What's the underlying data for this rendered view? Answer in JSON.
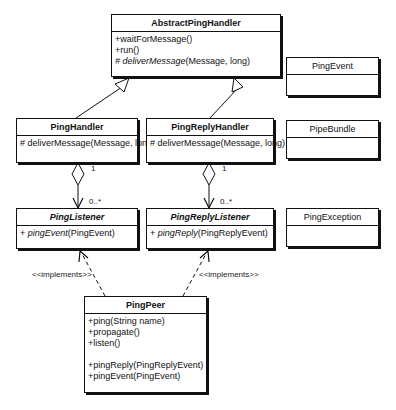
{
  "diagram": {
    "type": "UML class diagram",
    "classes": {
      "abstract_ping_handler": {
        "name": "AbstractPingHandler",
        "operations": [
          {
            "prefix": "+",
            "name": "waitForMessage",
            "params": "()",
            "italic": false
          },
          {
            "prefix": "+",
            "name": "run",
            "params": "()",
            "italic": false
          },
          {
            "prefix": "# ",
            "name": "deliverMessage",
            "params": "(Message, long)",
            "italic": true
          }
        ]
      },
      "ping_handler": {
        "name": "PingHandler",
        "operations": [
          {
            "prefix": "# ",
            "name": "deliverMessage",
            "params": "(Message, long)",
            "italic": false
          }
        ]
      },
      "ping_reply_handler": {
        "name": "PingReplyHandler",
        "operations": [
          {
            "prefix": "# ",
            "name": "deliverMessage",
            "params": "(Message, long)",
            "italic": false
          }
        ]
      },
      "ping_listener": {
        "name": "PingListener",
        "operations": [
          {
            "prefix": "+ ",
            "name": "pingEvent",
            "params": "(PingEvent)",
            "italic": true
          }
        ]
      },
      "ping_reply_listener": {
        "name": "PingReplyListener",
        "operations": [
          {
            "prefix": "+ ",
            "name": "pingReply",
            "params": "(PingReplyEvent)",
            "italic": true
          }
        ]
      },
      "ping_peer": {
        "name": "PingPeer",
        "operations": [
          {
            "prefix": "+",
            "name": "ping",
            "params": "(String name)"
          },
          {
            "prefix": "+",
            "name": "propagate",
            "params": "()"
          },
          {
            "prefix": "+",
            "name": "listen",
            "params": "()"
          },
          {
            "prefix": "+",
            "name": "pingReply",
            "params": "(PingReplyEvent)"
          },
          {
            "prefix": "+",
            "name": "pingEvent",
            "params": "(PingEvent)"
          }
        ]
      },
      "ping_event": {
        "name": "PingEvent"
      },
      "pipe_bundle": {
        "name": "PipeBundle"
      },
      "ping_exception": {
        "name": "PingException"
      }
    },
    "labels": {
      "mult_one_left": "1",
      "mult_many_left": "0..*",
      "mult_one_right": "1",
      "mult_many_right": "0..*",
      "implements_left": "<<implements>>",
      "implements_right": "<<implements>>"
    }
  }
}
